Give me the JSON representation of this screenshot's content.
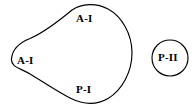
{
  "diagram": {
    "background_color": "#ffffff",
    "stroke_color": "#000000",
    "shapes": [
      {
        "id": "main-region",
        "kind": "closed-freeform-teardrop",
        "description": "Large closed irregular egg/teardrop outline with a rounded cusp at the left",
        "bounds": {
          "x": 9,
          "y": 4,
          "width": 124,
          "height": 99
        }
      },
      {
        "id": "secondary-region",
        "kind": "circle",
        "description": "Small separate circle at right",
        "center": {
          "x": 170,
          "y": 58
        },
        "radius": 18
      }
    ],
    "labels": [
      {
        "id": "a1-top",
        "text": "A-I",
        "x": 76,
        "y": 13,
        "inside": "main-region"
      },
      {
        "id": "a1-left",
        "text": "A-I",
        "x": 17,
        "y": 55,
        "inside": "main-region"
      },
      {
        "id": "p1",
        "text": "P-I",
        "x": 76,
        "y": 84,
        "inside": "main-region"
      },
      {
        "id": "p2",
        "text": "P-II",
        "x": 158,
        "y": 52,
        "inside": "secondary-region"
      }
    ]
  }
}
